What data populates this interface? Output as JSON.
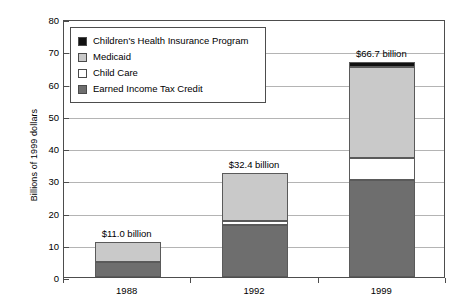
{
  "chart_data": {
    "type": "bar",
    "subtype": "stacked-bar",
    "title": "",
    "subtitle": "",
    "xlabel": "",
    "ylabel": "Billions of 1999 dollars",
    "categories": [
      "1988",
      "1992",
      "1999"
    ],
    "ylim": [
      0,
      80
    ],
    "ytick_step": 10,
    "yticks": [
      0,
      10,
      20,
      30,
      40,
      50,
      60,
      70,
      80
    ],
    "ytick_labels": [
      "0",
      "10",
      "20",
      "30",
      "40",
      "50",
      "60",
      "70",
      "80"
    ],
    "grid": true,
    "grid_axis": "y",
    "legend_position": "upper-left-inside",
    "stack_order_bottom_to_top": [
      "Earned Income Tax Credit",
      "Child Care",
      "Medicaid",
      "Children's Health Insurance Program"
    ],
    "series": [
      {
        "name": "Earned Income Tax Credit",
        "color": "#6e6e6e",
        "values": [
          4.5,
          16.0,
          30.2
        ]
      },
      {
        "name": "Child Care",
        "color": "#ffffff",
        "values": [
          0.0,
          1.4,
          6.6
        ]
      },
      {
        "name": "Medicaid",
        "color": "#c9c9c9",
        "values": [
          6.5,
          15.0,
          28.2
        ]
      },
      {
        "name": "Children's Health Insurance Program",
        "color": "#111111",
        "values": [
          0.0,
          0.0,
          1.7
        ]
      }
    ],
    "totals": [
      11.0,
      32.4,
      66.7
    ],
    "total_labels": [
      "$11.0 billion",
      "$32.4 billion",
      "$66.7 billion"
    ],
    "annotations": [
      {
        "category": "1988",
        "text": "$11.0 billion"
      },
      {
        "category": "1992",
        "text": "$32.4 billion"
      },
      {
        "category": "1999",
        "text": "$66.7 billion"
      }
    ]
  },
  "legend": {
    "items": [
      {
        "label": "Children's Health Insurance Program",
        "color": "#111111"
      },
      {
        "label": "Medicaid",
        "color": "#c9c9c9"
      },
      {
        "label": "Child Care",
        "color": "#ffffff"
      },
      {
        "label": "Earned Income Tax Credit",
        "color": "#6e6e6e"
      }
    ]
  },
  "axes": {
    "y_title": "Billions of 1999 dollars"
  },
  "colors": {
    "frame": "#4d4d4d",
    "gridline": "#b4b4b4",
    "bar_outline": "#5a5a5a",
    "background": "#ffffff",
    "text": "#000000"
  }
}
